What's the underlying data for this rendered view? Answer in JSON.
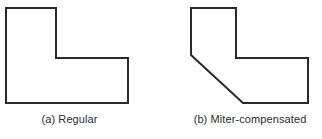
{
  "figure": {
    "background_color": "#ffffff",
    "stroke_color": "#2a2a2a",
    "stroke_width": 2,
    "width": 322,
    "height": 139,
    "panels": [
      {
        "id": "a",
        "caption": "(a) Regular",
        "shape_name": "l-shaped-polygon-regular",
        "description": "L-shaped polygon with square corners",
        "points": "6,8 56,8 56,58 128,58 128,103 6,103",
        "vertices": [
          [
            6,
            8
          ],
          [
            56,
            8
          ],
          [
            56,
            58
          ],
          [
            128,
            58
          ],
          [
            128,
            103
          ],
          [
            6,
            103
          ]
        ]
      },
      {
        "id": "b",
        "caption": "(b) Miter-compensated",
        "shape_name": "l-shaped-polygon-miter-compensated",
        "description": "L-shaped polygon with the lower-left corner chamfered by a diagonal miter cut",
        "points": "191,8 236,8 236,58 308,58 308,103 243,103 191,55",
        "vertices": [
          [
            191,
            8
          ],
          [
            236,
            8
          ],
          [
            236,
            58
          ],
          [
            308,
            58
          ],
          [
            308,
            103
          ],
          [
            243,
            103
          ],
          [
            191,
            55
          ]
        ]
      }
    ]
  }
}
